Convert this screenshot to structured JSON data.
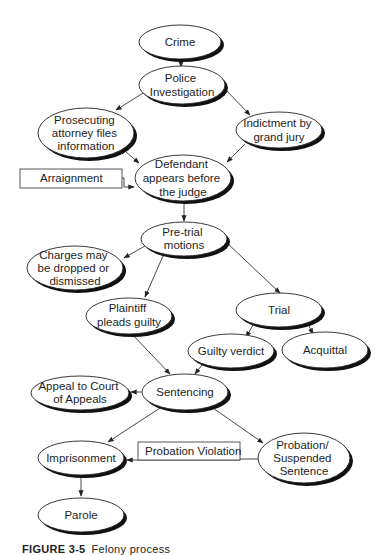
{
  "diagram": {
    "nodes": {
      "crime": {
        "lines": [
          "Crime"
        ]
      },
      "police": {
        "lines": [
          "Police",
          "Investigation"
        ]
      },
      "prosecuting": {
        "lines": [
          "Prosecuting",
          "attorney files",
          "information"
        ]
      },
      "indictment": {
        "lines": [
          "Indictment by",
          "grand jury"
        ]
      },
      "defendant": {
        "lines": [
          "Defendant",
          "appears before",
          "the judge"
        ]
      },
      "pretrial": {
        "lines": [
          "Pre-trial",
          "motions"
        ]
      },
      "charges": {
        "lines": [
          "Charges may",
          "be dropped or",
          "dismissed"
        ]
      },
      "plaintiff": {
        "lines": [
          "Plaintiff",
          "pleads guilty"
        ]
      },
      "trial": {
        "lines": [
          "Trial"
        ]
      },
      "guilty": {
        "lines": [
          "Guilty verdict"
        ]
      },
      "acquittal": {
        "lines": [
          "Acquittal"
        ]
      },
      "sentencing": {
        "lines": [
          "Sentencing"
        ]
      },
      "appeal": {
        "lines": [
          "Appeal to Court",
          "of Appeals"
        ]
      },
      "imprisonment": {
        "lines": [
          "Imprisonment"
        ]
      },
      "probation": {
        "lines": [
          "Probation/",
          "Suspended",
          "Sentence"
        ]
      },
      "parole": {
        "lines": [
          "Parole"
        ]
      }
    },
    "labels": {
      "arraignment": "Arraignment",
      "probation_violation": "Probation Violation"
    },
    "edges": [
      [
        "crime",
        "police"
      ],
      [
        "police",
        "prosecuting"
      ],
      [
        "police",
        "indictment"
      ],
      [
        "prosecuting",
        "defendant"
      ],
      [
        "indictment",
        "defendant"
      ],
      [
        "arraignment",
        "defendant"
      ],
      [
        "defendant",
        "pretrial"
      ],
      [
        "pretrial",
        "charges"
      ],
      [
        "pretrial",
        "plaintiff"
      ],
      [
        "pretrial",
        "trial"
      ],
      [
        "trial",
        "guilty"
      ],
      [
        "trial",
        "acquittal"
      ],
      [
        "plaintiff",
        "sentencing"
      ],
      [
        "guilty",
        "sentencing"
      ],
      [
        "sentencing",
        "appeal"
      ],
      [
        "sentencing",
        "imprisonment"
      ],
      [
        "sentencing",
        "probation"
      ],
      [
        "probation",
        "imprisonment"
      ],
      [
        "imprisonment",
        "parole"
      ]
    ]
  },
  "caption": {
    "label": "FIGURE 3-5",
    "rest": "Felony process"
  }
}
